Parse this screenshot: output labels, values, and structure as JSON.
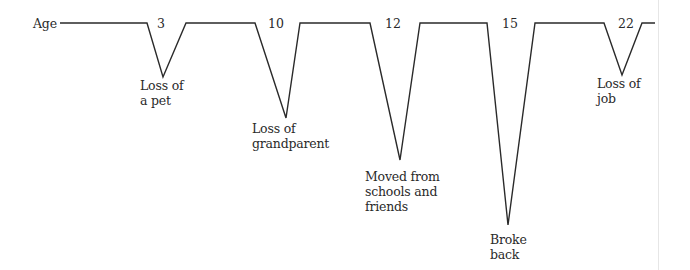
{
  "diagram": {
    "axis_label": "Age",
    "line_color": "#2a2a2a",
    "events": [
      {
        "age": "3",
        "label_line1": "Loss of",
        "label_line2": "a pet",
        "label_line3": ""
      },
      {
        "age": "10",
        "label_line1": "Loss of",
        "label_line2": "grandparent",
        "label_line3": ""
      },
      {
        "age": "12",
        "label_line1": "Moved from",
        "label_line2": "schools and",
        "label_line3": "friends"
      },
      {
        "age": "15",
        "label_line1": "Broke",
        "label_line2": "back",
        "label_line3": ""
      },
      {
        "age": "22",
        "label_line1": "Loss of",
        "label_line2": "job",
        "label_line3": ""
      }
    ]
  }
}
